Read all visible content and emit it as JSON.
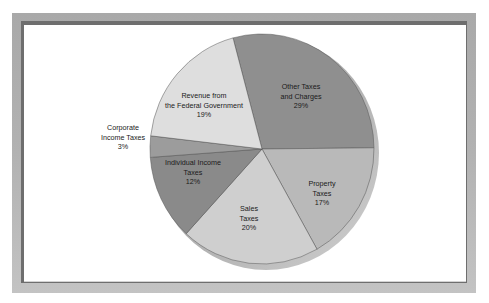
{
  "chart_data": {
    "type": "pie",
    "title": "",
    "style": "3d-tilted",
    "slices": [
      {
        "label": "Other Taxes and Charges",
        "label_lines": [
          "Other Taxes",
          "and Charges",
          "29%"
        ],
        "value": 29,
        "color": "#8f8f8f"
      },
      {
        "label": "Property Taxes",
        "label_lines": [
          "Property",
          "Taxes",
          "17%"
        ],
        "value": 17,
        "color": "#b9b9b9"
      },
      {
        "label": "Sales Taxes",
        "label_lines": [
          "Sales",
          "Taxes",
          "20%"
        ],
        "value": 20,
        "color": "#cfcfcf"
      },
      {
        "label": "Individual Income Taxes",
        "label_lines": [
          "Individual Income",
          "Taxes",
          "12%"
        ],
        "value": 12,
        "color": "#8a8a8a"
      },
      {
        "label": "Corporate Income Taxes",
        "label_lines": [
          "Corporate",
          "Income Taxes",
          "3%"
        ],
        "value": 3,
        "color": "#9c9c9c"
      },
      {
        "label": "Revenue from the Federal Government",
        "label_lines": [
          "Revenue from",
          "the Federal Government",
          "19%"
        ],
        "value": 19,
        "color": "#dedede"
      }
    ],
    "legend": "none (labels placed on slices)",
    "units": "%"
  }
}
